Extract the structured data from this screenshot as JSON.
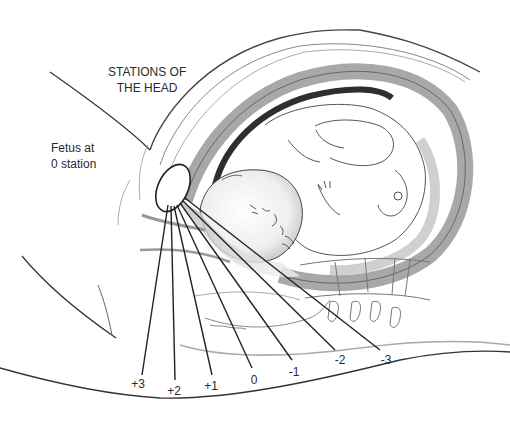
{
  "diagram": {
    "title_lines": [
      "STATIONS OF",
      "THE HEAD"
    ],
    "fetus_label_lines": [
      "Fetus at",
      "0 station"
    ],
    "stations": [
      {
        "label": "+3",
        "x": 138,
        "y": 384
      },
      {
        "label": "+2",
        "x": 174,
        "y": 391
      },
      {
        "label": "+1",
        "x": 211,
        "y": 386
      },
      {
        "label": "0",
        "x": 254,
        "y": 380
      },
      {
        "label": "-1",
        "x": 294,
        "y": 372
      },
      {
        "label": "-2",
        "x": 340,
        "y": 360
      },
      {
        "label": "-3",
        "x": 386,
        "y": 360
      }
    ],
    "colors": {
      "line": "#222222",
      "outline": "#555555",
      "light_outline": "#9a9a9a",
      "uterine_wall": "#a8a8a8",
      "dark_fill": "#333333",
      "background": "#ffffff"
    }
  }
}
